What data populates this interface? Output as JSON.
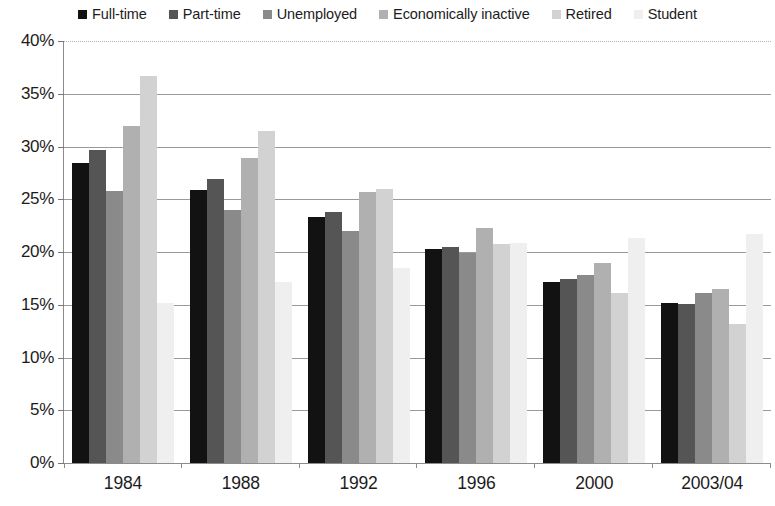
{
  "legend": {
    "position": "top-center",
    "items": [
      {
        "label": "Full-time",
        "color": "#121212"
      },
      {
        "label": "Part-time",
        "color": "#555555"
      },
      {
        "label": "Unemployed",
        "color": "#8a8a8a"
      },
      {
        "label": "Economically inactive",
        "color": "#b0b0b0"
      },
      {
        "label": "Retired",
        "color": "#d2d2d2"
      },
      {
        "label": "Student",
        "color": "#efefef"
      }
    ]
  },
  "axes": {
    "y_ticks": [
      "0%",
      "5%",
      "10%",
      "15%",
      "20%",
      "25%",
      "30%",
      "35%",
      "40%"
    ],
    "x_ticks": [
      "1984",
      "1988",
      "1992",
      "1996",
      "2000",
      "2003/04"
    ]
  },
  "chart_data": {
    "type": "bar",
    "title": "",
    "xlabel": "",
    "ylabel": "",
    "ylim": [
      0,
      40
    ],
    "ytick_step": 5,
    "grid": true,
    "legend_position": "top-center",
    "value_suffix": "%",
    "categories": [
      "1984",
      "1988",
      "1992",
      "1996",
      "2000",
      "2003/04"
    ],
    "series": [
      {
        "name": "Full-time",
        "color": "#121212",
        "values": [
          28.4,
          25.9,
          23.3,
          20.3,
          17.2,
          15.2
        ]
      },
      {
        "name": "Part-time",
        "color": "#555555",
        "values": [
          29.7,
          26.9,
          23.8,
          20.5,
          17.4,
          15.1
        ]
      },
      {
        "name": "Unemployed",
        "color": "#8a8a8a",
        "values": [
          25.8,
          24.0,
          22.0,
          19.9,
          17.8,
          16.1
        ]
      },
      {
        "name": "Economically inactive",
        "color": "#b0b0b0",
        "values": [
          31.9,
          28.9,
          25.7,
          22.3,
          19.0,
          16.5
        ]
      },
      {
        "name": "Retired",
        "color": "#d2d2d2",
        "values": [
          36.7,
          31.5,
          26.0,
          20.8,
          16.1,
          13.2
        ]
      },
      {
        "name": "Student",
        "color": "#efefef",
        "values": [
          15.2,
          17.2,
          18.5,
          20.9,
          21.3,
          21.7
        ]
      }
    ]
  }
}
